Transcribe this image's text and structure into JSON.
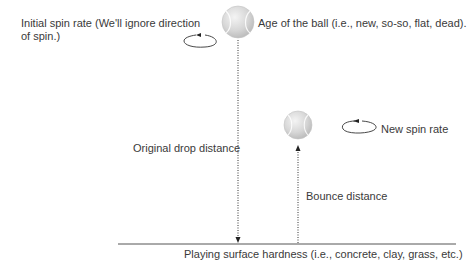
{
  "diagram": {
    "labels": {
      "initial_spin_line1": "Initial spin rate (We'll ignore direction",
      "initial_spin_line2": "of spin.)",
      "ball_age": "Age of the ball (i.e., new, so-so, flat, dead).",
      "new_spin_rate": "New spin rate",
      "original_drop": "Original drop distance",
      "bounce_distance": "Bounce distance",
      "surface": "Playing surface hardness (i.e., concrete, clay, grass, etc.)"
    },
    "icons": {
      "initial_spin": "counterclockwise-spin-arrow-icon",
      "new_spin": "counterclockwise-spin-arrow-icon",
      "ball_top": "tennis-ball-icon",
      "ball_bounce": "tennis-ball-icon"
    },
    "colors": {
      "ball_fill": "#d4d4d4",
      "ball_highlight": "#f2f2f2",
      "line": "#333333",
      "text": "#3a3a3a"
    }
  }
}
